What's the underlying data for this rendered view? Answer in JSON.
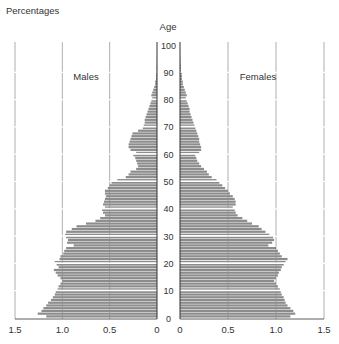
{
  "chart_data": {
    "type": "bar",
    "subtype": "population-pyramid",
    "title": "Percentages",
    "ylabel": "Age",
    "xlabel": "",
    "y_ticks": [
      0,
      10,
      20,
      30,
      40,
      50,
      60,
      70,
      80,
      90,
      100
    ],
    "x_ticks_left": [
      "1.5",
      "1.0",
      "0.5",
      "0"
    ],
    "x_ticks_right": [
      "0",
      "0.5",
      "1.0",
      "1.5"
    ],
    "xlim": [
      0,
      1.5
    ],
    "ylim": [
      0,
      100
    ],
    "grid": true,
    "legend": {
      "left": "Males",
      "right": "Females"
    },
    "bar_color": "#8c8c8c",
    "ages": [
      0,
      1,
      2,
      3,
      4,
      5,
      6,
      7,
      8,
      9,
      10,
      11,
      12,
      13,
      14,
      15,
      16,
      17,
      18,
      19,
      20,
      21,
      22,
      23,
      24,
      25,
      26,
      27,
      28,
      29,
      30,
      31,
      32,
      33,
      34,
      35,
      36,
      37,
      38,
      39,
      40,
      41,
      42,
      43,
      44,
      45,
      46,
      47,
      48,
      49,
      50,
      51,
      52,
      53,
      54,
      55,
      56,
      57,
      58,
      59,
      60,
      61,
      62,
      63,
      64,
      65,
      66,
      67,
      68,
      69,
      70,
      71,
      72,
      73,
      74,
      75,
      76,
      77,
      78,
      79,
      80,
      81,
      82,
      83,
      84,
      85,
      86,
      87,
      88,
      89,
      90,
      91,
      92,
      93,
      94,
      95,
      96,
      97,
      98,
      99,
      100
    ],
    "series": [
      {
        "name": "Males",
        "values": [
          1.17,
          1.26,
          1.22,
          1.2,
          1.17,
          1.15,
          1.12,
          1.1,
          1.08,
          1.07,
          1.05,
          1.04,
          1.02,
          1.0,
          1.02,
          1.05,
          1.07,
          1.09,
          1.04,
          1.06,
          1.08,
          1.03,
          1.02,
          0.99,
          0.98,
          0.96,
          0.88,
          0.95,
          0.94,
          0.96,
          0.97,
          0.96,
          0.9,
          0.85,
          0.75,
          0.65,
          0.6,
          0.55,
          0.57,
          0.58,
          0.55,
          0.57,
          0.56,
          0.55,
          0.54,
          0.55,
          0.55,
          0.52,
          0.5,
          0.48,
          0.42,
          0.33,
          0.3,
          0.28,
          0.22,
          0.2,
          0.21,
          0.22,
          0.23,
          0.25,
          0.22,
          0.28,
          0.3,
          0.3,
          0.29,
          0.28,
          0.27,
          0.26,
          0.2,
          0.15,
          0.14,
          0.13,
          0.13,
          0.12,
          0.11,
          0.1,
          0.09,
          0.08,
          0.07,
          0.06,
          0.05,
          0.06,
          0.05,
          0.04,
          0.03,
          0.02,
          0.02,
          0.01,
          0.01,
          0.01,
          0.005,
          0.005,
          0.003,
          0.002,
          0.002,
          0.001,
          0.001,
          0.0,
          0.0,
          0.0,
          0.0
        ]
      },
      {
        "name": "Females",
        "values": [
          1.15,
          1.2,
          1.18,
          1.15,
          1.12,
          1.1,
          1.09,
          1.08,
          1.06,
          1.05,
          1.04,
          1.02,
          1.0,
          0.98,
          1.0,
          1.02,
          1.03,
          1.05,
          1.06,
          1.08,
          1.1,
          1.12,
          1.06,
          1.04,
          1.02,
          1.0,
          0.92,
          0.96,
          0.98,
          0.97,
          0.93,
          0.89,
          0.85,
          0.82,
          0.75,
          0.7,
          0.65,
          0.6,
          0.58,
          0.57,
          0.55,
          0.58,
          0.58,
          0.57,
          0.55,
          0.52,
          0.5,
          0.47,
          0.44,
          0.41,
          0.38,
          0.33,
          0.3,
          0.28,
          0.25,
          0.22,
          0.2,
          0.18,
          0.17,
          0.16,
          0.2,
          0.22,
          0.22,
          0.21,
          0.2,
          0.2,
          0.19,
          0.18,
          0.17,
          0.16,
          0.15,
          0.14,
          0.13,
          0.12,
          0.11,
          0.1,
          0.1,
          0.09,
          0.08,
          0.07,
          0.06,
          0.07,
          0.06,
          0.05,
          0.04,
          0.03,
          0.03,
          0.02,
          0.02,
          0.02,
          0.01,
          0.01,
          0.008,
          0.006,
          0.004,
          0.003,
          0.002,
          0.001,
          0.001,
          0.0,
          0.0
        ]
      }
    ]
  },
  "labels": {
    "title": "Percentages",
    "y_axis": "Age",
    "males": "Males",
    "females": "Females"
  }
}
